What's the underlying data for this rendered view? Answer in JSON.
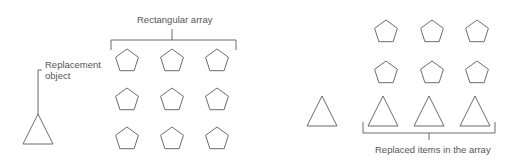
{
  "left_panel": {
    "array_label": "Rectangular array",
    "replacement_label_line1": "Replacement",
    "replacement_label_line2": "object",
    "array_rows": 3,
    "array_cols": 3,
    "array_shape": "pentagon",
    "replacement_shape": "triangle"
  },
  "right_panel": {
    "replaced_label": "Replaced items in the array",
    "rows": [
      [
        "pentagon",
        "pentagon",
        "pentagon"
      ],
      [
        "pentagon",
        "pentagon",
        "pentagon"
      ],
      [
        "triangle",
        "triangle",
        "triangle"
      ]
    ],
    "source_shape": "triangle"
  },
  "colors": {
    "stroke": "#6b6b6b",
    "text": "#555555",
    "background": "#ffffff"
  }
}
